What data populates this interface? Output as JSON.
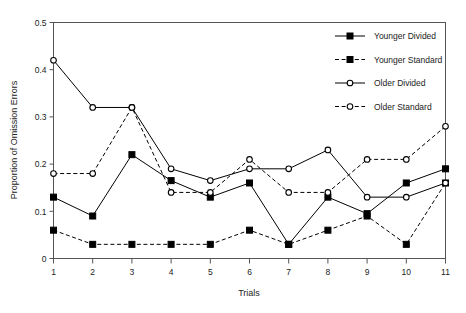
{
  "chart_data": {
    "type": "line",
    "title": "",
    "xlabel": "Trials",
    "ylabel": "Proportion of Omission Errors",
    "categories": [
      1,
      2,
      3,
      4,
      5,
      6,
      7,
      8,
      9,
      10,
      11
    ],
    "x": [
      1,
      2,
      3,
      4,
      5,
      6,
      7,
      8,
      9,
      10,
      11
    ],
    "xlim": [
      1,
      11
    ],
    "ylim": [
      0,
      0.5
    ],
    "yticks": [
      0,
      0.1,
      0.2,
      0.3,
      0.4,
      0.5
    ],
    "ytick_labels": [
      "0",
      "0.1",
      "0.2",
      "0.3",
      "0.4",
      "0.5"
    ],
    "xticks": [
      1,
      2,
      3,
      4,
      5,
      6,
      7,
      8,
      9,
      10,
      11
    ],
    "xtick_labels": [
      "1",
      "2",
      "3",
      "4",
      "5",
      "6",
      "7",
      "8",
      "9",
      "10",
      "11"
    ],
    "grid": false,
    "legend_position": "top-right",
    "frame": "box",
    "series": [
      {
        "name": "Younger Divided",
        "marker": "filled-square",
        "line": "solid",
        "color": "#000000",
        "values": [
          0.13,
          0.09,
          0.22,
          0.165,
          0.13,
          0.16,
          0.03,
          0.13,
          0.095,
          0.16,
          0.19
        ]
      },
      {
        "name": "Younger Standard",
        "marker": "filled-square",
        "line": "dashed",
        "color": "#000000",
        "values": [
          0.06,
          0.03,
          0.03,
          0.03,
          0.03,
          0.06,
          0.03,
          0.06,
          0.09,
          0.03,
          0.16
        ]
      },
      {
        "name": "Older Divided",
        "marker": "open-circle",
        "line": "solid",
        "color": "#000000",
        "values": [
          0.42,
          0.32,
          0.32,
          0.19,
          0.165,
          0.19,
          0.19,
          0.23,
          0.13,
          0.13,
          0.16
        ]
      },
      {
        "name": "Older Standard",
        "marker": "open-circle",
        "line": "dashed",
        "color": "#000000",
        "values": [
          0.18,
          0.18,
          0.32,
          0.14,
          0.14,
          0.21,
          0.14,
          0.14,
          0.21,
          0.21,
          0.28
        ]
      }
    ]
  },
  "legend": {
    "items": [
      {
        "label": "Younger Divided"
      },
      {
        "label": "Younger Standard"
      },
      {
        "label": "Older Divided"
      },
      {
        "label": "Older Standard"
      }
    ]
  }
}
